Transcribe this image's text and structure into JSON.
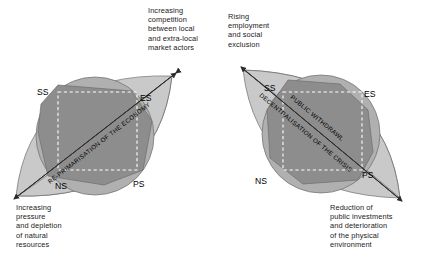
{
  "figure": {
    "type": "conceptual-diagram",
    "panels": [
      {
        "id": "left",
        "diagonal_label": "RE-PRIMARISATION OF THE ECONOMY",
        "node_labels": {
          "top_left": "SS",
          "top_right": "ES",
          "bottom_left": "NS",
          "bottom_right": "PS"
        },
        "captions": {
          "top": "Increasing\ncompetition\nbetween local\nand extra-local\nmarket actors",
          "bottom": "Increasing\npressure\nand depletion\nof natural\nresources"
        }
      },
      {
        "id": "right",
        "diagonal_label_1": "PUBLIC WITHDRAWL",
        "diagonal_label_2": "DECENTRALISATION OF THE CRISIS",
        "node_labels": {
          "top_left": "SS",
          "top_right": "ES",
          "bottom_left": "NS",
          "bottom_right": "PS"
        },
        "captions": {
          "top": "Rising\nemployment\nand social\nexclusion",
          "bottom": "Reduction of\npublic investments\nand deterioration\nof the physical\nenvironment"
        }
      }
    ]
  },
  "colors": {
    "lens_fill": "#c9c9c9",
    "circle_fill": "#b0b0b0",
    "polygon_fill": "#8d8d8d",
    "stroke": "#4a4a4a",
    "dashed_square": "#ffffff",
    "text": "#1a1a1a",
    "background": "#ffffff"
  }
}
